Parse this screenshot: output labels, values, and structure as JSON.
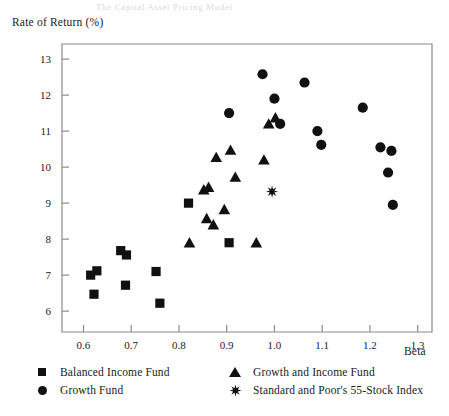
{
  "figure": {
    "bleed_through_text": "The Capital Asset Pricing Model",
    "y_axis_label": "Rate of Return (%)",
    "x_axis_label": "Beta"
  },
  "legend": {
    "items": [
      {
        "key": "balanced-income-fund",
        "marker": "square-marker",
        "label": "Balanced Income Fund"
      },
      {
        "key": "growth-fund",
        "marker": "circle-marker",
        "label": "Growth Fund"
      },
      {
        "key": "growth-and-income-fund",
        "marker": "triangle-marker",
        "label": "Growth and Income Fund"
      },
      {
        "key": "sp-55-stock-index",
        "marker": "star-marker",
        "label": "Standard and Poor's 55-Stock Index"
      }
    ]
  },
  "colors": {
    "marker": "#111111",
    "axis": "#8a8a8a",
    "text": "#1a1a1a"
  },
  "chart_data": {
    "type": "scatter",
    "title": "",
    "xlabel": "Beta",
    "ylabel": "Rate of Return (%)",
    "xlim": [
      0.555,
      1.33
    ],
    "ylim": [
      5.42,
      13.42
    ],
    "xticks": [
      "0.6",
      "0.7",
      "0.8",
      "0.9",
      "1.0",
      "1.1",
      "1.2",
      "1.3"
    ],
    "xtick_values": [
      0.6,
      0.7,
      0.8,
      0.9,
      1.0,
      1.1,
      1.2,
      1.3
    ],
    "yticks": [
      "6",
      "7",
      "8",
      "9",
      "10",
      "11",
      "12",
      "13"
    ],
    "ytick_values": [
      6,
      7,
      8,
      9,
      10,
      11,
      12,
      13
    ],
    "grid": false,
    "legend_position": "below-axes",
    "series": [
      {
        "name": "Balanced Income Fund",
        "marker": "square",
        "color": "#111111",
        "points": [
          [
            0.615,
            7.0
          ],
          [
            0.628,
            7.12
          ],
          [
            0.622,
            6.47
          ],
          [
            0.678,
            7.68
          ],
          [
            0.69,
            7.56
          ],
          [
            0.688,
            6.72
          ],
          [
            0.752,
            7.1
          ],
          [
            0.76,
            6.22
          ],
          [
            0.82,
            9.0
          ],
          [
            0.905,
            7.9
          ]
        ]
      },
      {
        "name": "Growth Fund",
        "marker": "circle",
        "color": "#111111",
        "points": [
          [
            0.905,
            11.5
          ],
          [
            0.975,
            12.58
          ],
          [
            1.0,
            11.9
          ],
          [
            1.012,
            11.2
          ],
          [
            1.063,
            12.35
          ],
          [
            1.09,
            11.0
          ],
          [
            1.098,
            10.62
          ],
          [
            1.185,
            11.65
          ],
          [
            1.222,
            10.55
          ],
          [
            1.238,
            9.85
          ],
          [
            1.245,
            10.45
          ],
          [
            1.248,
            8.95
          ]
        ]
      },
      {
        "name": "Growth and Income Fund",
        "marker": "triangle",
        "color": "#111111",
        "points": [
          [
            0.822,
            7.88
          ],
          [
            0.852,
            9.35
          ],
          [
            0.862,
            9.42
          ],
          [
            0.858,
            8.55
          ],
          [
            0.872,
            8.38
          ],
          [
            0.878,
            10.25
          ],
          [
            0.895,
            8.8
          ],
          [
            0.908,
            10.45
          ],
          [
            0.918,
            9.7
          ],
          [
            0.962,
            7.88
          ],
          [
            0.978,
            10.18
          ],
          [
            0.988,
            11.18
          ],
          [
            1.002,
            11.35
          ]
        ]
      },
      {
        "name": "Standard and Poor's 55-Stock Index",
        "marker": "star",
        "color": "#111111",
        "points": [
          [
            0.995,
            9.32
          ]
        ]
      }
    ]
  }
}
